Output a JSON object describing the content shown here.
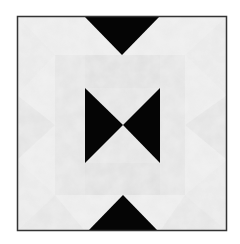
{
  "image": {
    "subject": "Quilt block with black bowtie and triangle patches on light mottled grey fabric",
    "colors": {
      "background": "#ffffff",
      "fabric_light": "#ebebeb",
      "fabric_mid": "#e0e0e0",
      "fabric_shade": "#d9d9d9",
      "patch_dark": "#050505",
      "border": "#333333"
    },
    "shapes": [
      {
        "name": "top-triangle",
        "type": "triangle"
      },
      {
        "name": "center-bowtie-left",
        "type": "triangle"
      },
      {
        "name": "center-bowtie-right",
        "type": "triangle"
      },
      {
        "name": "bottom-triangle",
        "type": "triangle"
      }
    ]
  }
}
